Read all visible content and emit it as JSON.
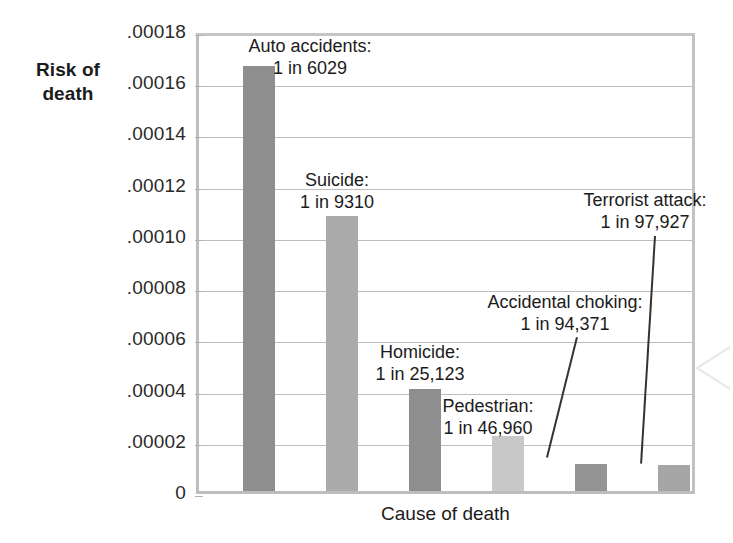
{
  "chart_data": {
    "type": "bar",
    "title": "",
    "xlabel": "Cause of death",
    "ylabel": "Risk of death",
    "ylim": [
      0,
      0.00018
    ],
    "grid": true,
    "legend": "none",
    "ytick_labels": [
      ".00018",
      ".00016",
      ".00014",
      ".00012",
      ".00010",
      ".00008",
      ".00006",
      ".00004",
      ".00002",
      "0"
    ],
    "ytick_values": [
      0.00018,
      0.00016,
      0.00014,
      0.00012,
      0.0001,
      8e-05,
      6e-05,
      4e-05,
      2e-05,
      0
    ],
    "categories": [
      "Auto accidents",
      "Suicide",
      "Homicide",
      "Pedestrian",
      "Accidental choking",
      "Terrorist attack"
    ],
    "values": [
      0.00016588,
      0.00010741,
      3.98e-05,
      2.13e-05,
      1.06e-05,
      1.021e-05
    ],
    "odds": [
      "1 in 6029",
      "1 in 9310",
      "1 in 25,123",
      "1 in 46,960",
      "1 in 94,371",
      "1 in 97,927"
    ],
    "bar_colors": [
      "#8e8e8e",
      "#ababab",
      "#8e8e8e",
      "#c8c8c8",
      "#949494",
      "#a6a6a6"
    ]
  },
  "axes": {
    "y_title_line1": "Risk of",
    "y_title_line2": "death",
    "x_title": "Cause of death"
  },
  "annotations": [
    {
      "name": "auto-accidents",
      "label": "Auto accidents:",
      "value": "1 in 6029"
    },
    {
      "name": "suicide",
      "label": "Suicide:",
      "value": "1 in 9310"
    },
    {
      "name": "homicide",
      "label": "Homicide:",
      "value": "1 in 25,123"
    },
    {
      "name": "pedestrian",
      "label": "Pedestrian:",
      "value": "1 in 46,960"
    },
    {
      "name": "accidental-choking",
      "label": "Accidental choking:",
      "value": "1 in 94,371"
    },
    {
      "name": "terrorist-attack",
      "label": "Terrorist attack:",
      "value": "1 in 97,927"
    }
  ]
}
